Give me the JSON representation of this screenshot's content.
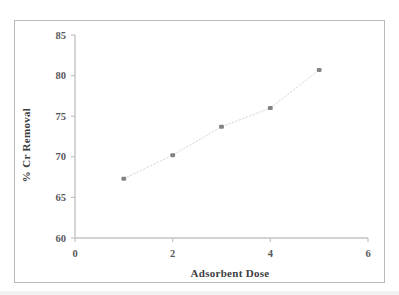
{
  "figure": {
    "background_color": "#ffffff",
    "frame_color": "#b9b9b9",
    "axis_color": "#c3c3c3",
    "marker_color": "#6e6e70",
    "line_color": "#d6d6d8",
    "tick_label_color": "#58585a",
    "axis_title_color": "#3d3d3f"
  },
  "chart_data": {
    "type": "scatter",
    "title": "",
    "subtitle": "",
    "xlabel": "Adsorbent Dose",
    "ylabel": "% Cr Removal",
    "xlim": [
      0,
      6
    ],
    "ylim": [
      60,
      85
    ],
    "xticks": [
      0,
      2,
      4,
      6
    ],
    "xtick_labels": [
      "0",
      "2",
      "4",
      "6"
    ],
    "yticks": [
      60,
      65,
      70,
      75,
      80,
      85
    ],
    "ytick_labels": [
      "60",
      "65",
      "70",
      "75",
      "80",
      "85"
    ],
    "grid": false,
    "legend": null,
    "legend_position": "none",
    "series": [
      {
        "name": "% Cr Removal",
        "marker": "diamond",
        "line_style": "dotted",
        "x": [
          1,
          2,
          3,
          4,
          5
        ],
        "y": [
          67.3,
          70.2,
          73.7,
          76.0,
          80.7
        ],
        "points": [
          {
            "x": 1,
            "y": 67.3
          },
          {
            "x": 2,
            "y": 70.2
          },
          {
            "x": 3,
            "y": 73.7
          },
          {
            "x": 4,
            "y": 76.0
          },
          {
            "x": 5,
            "y": 80.7
          }
        ]
      }
    ],
    "annotations": []
  }
}
